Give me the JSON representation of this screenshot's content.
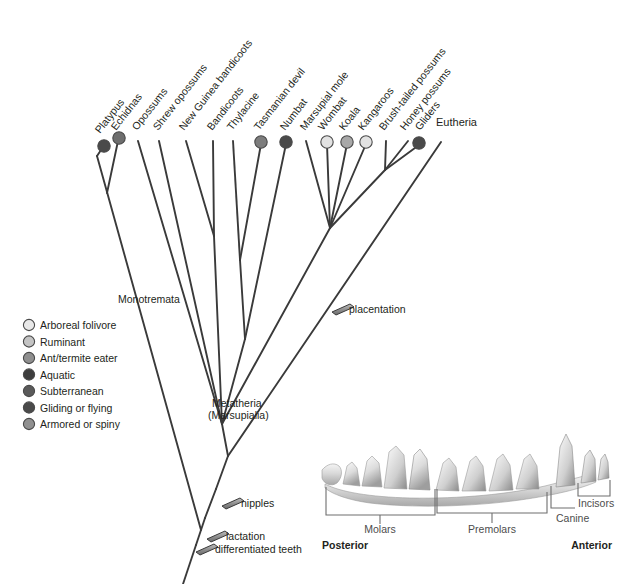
{
  "figure": {
    "type": "phylogenetic-cladogram",
    "title": "",
    "palette": {
      "branch": "#3a3a3a",
      "text": "#231f20",
      "bracket": "#6e6e6e",
      "bar_fill": "#8c8c8c",
      "background": "#ffffff"
    }
  },
  "tips": [
    {
      "label": "Platypus",
      "x": 103,
      "y": 145,
      "trait": "Aquatic",
      "color": "#4a4a4a",
      "has_circle": true
    },
    {
      "label": "Echidnas",
      "x": 117,
      "y": 138,
      "trait": "Ant/termite eater",
      "color": "#6e6e6e",
      "has_circle": true
    },
    {
      "label": "Opossums",
      "x": 138,
      "y": 138,
      "trait": "",
      "color": "",
      "has_circle": false
    },
    {
      "label": "Shrew opossums",
      "x": 159,
      "y": 138,
      "trait": "",
      "color": "",
      "has_circle": false
    },
    {
      "label": "New Guinea bandicoots",
      "x": 185,
      "y": 138,
      "trait": "",
      "color": "",
      "has_circle": false
    },
    {
      "label": "Bandicoots",
      "x": 213,
      "y": 138,
      "trait": "",
      "color": "",
      "has_circle": false
    },
    {
      "label": "Thylacine",
      "x": 238,
      "y": 138,
      "trait": "",
      "color": "",
      "has_circle": false
    },
    {
      "label": "Tasmanian devil",
      "x": 263,
      "y": 138,
      "trait": "Ruminant",
      "color": "#7d7d7d",
      "has_circle": true
    },
    {
      "label": "Numbat",
      "x": 288,
      "y": 138,
      "trait": "Ant/termite eater",
      "color": "#4a4a4a",
      "has_circle": true
    },
    {
      "label": "Marsupial mole",
      "x": 311,
      "y": 138,
      "trait": "",
      "color": "",
      "has_circle": false
    },
    {
      "label": "Wombat",
      "x": 329,
      "y": 138,
      "trait": "Arboreal folivore",
      "color": "#e2e2e2",
      "has_circle": true
    },
    {
      "label": "Koala",
      "x": 350,
      "y": 138,
      "trait": "Ruminant",
      "color": "#a8a8a8",
      "has_circle": true
    },
    {
      "label": "Kangaroos",
      "x": 369,
      "y": 138,
      "trait": "Arboreal folivore",
      "color": "#e2e2e2",
      "has_circle": true
    },
    {
      "label": "Brush-tailed possums",
      "x": 390,
      "y": 138,
      "trait": "",
      "color": "",
      "has_circle": false
    },
    {
      "label": "Honey possums",
      "x": 412,
      "y": 138,
      "trait": "",
      "color": "",
      "has_circle": false
    },
    {
      "label": "Gliders",
      "x": 424,
      "y": 138,
      "trait": "Gliding or flying",
      "color": "#4a4a4a",
      "has_circle": true
    }
  ],
  "eutheria": {
    "label": "Eutheria",
    "x": 436,
    "y": 125
  },
  "clades": [
    {
      "label": "Monotremata",
      "x": 118,
      "y": 300
    },
    {
      "label": "Metatheria",
      "x": 212,
      "y": 404
    },
    {
      "label": "(Marsupialia)",
      "x": 212,
      "y": 416
    }
  ],
  "characters": [
    {
      "label": "placentation",
      "x": 348,
      "y": 311,
      "bar_x": 339,
      "bar_y": 308
    },
    {
      "label": "nipples",
      "x": 238,
      "y": 504,
      "bar_x": 228,
      "bar_y": 500
    },
    {
      "label": "lactation",
      "x": 223,
      "y": 537,
      "bar_x": 213,
      "bar_y": 533
    },
    {
      "label": "differentiated teeth",
      "x": 210,
      "y": 550,
      "bar_x": 200,
      "bar_y": 546
    }
  ],
  "legend": {
    "x": 24,
    "y": 325,
    "row_height": 16.5,
    "items": [
      {
        "label": "Arboreal folivore",
        "color": "#e8e8e8"
      },
      {
        "label": "Ruminant",
        "color": "#c4c4c4"
      },
      {
        "label": "Ant/termite eater",
        "color": "#8f8f8f"
      },
      {
        "label": "Aquatic",
        "color": "#3d3d3d"
      },
      {
        "label": "Subterranean",
        "color": "#5a5a5a"
      },
      {
        "label": "Gliding or flying",
        "color": "#4a4a4a"
      },
      {
        "label": "Armored or spiny",
        "color": "#909090"
      }
    ]
  },
  "jaw_diagram": {
    "caption_left": "Posterior",
    "caption_right": "Anterior",
    "tooth_groups": [
      {
        "label": "Molars",
        "x": 380,
        "y": 532
      },
      {
        "label": "Premolars",
        "x": 472,
        "y": 532
      },
      {
        "label": "Canine",
        "x": 556,
        "y": 521
      },
      {
        "label": "Incisors",
        "x": 581,
        "y": 507
      }
    ]
  }
}
